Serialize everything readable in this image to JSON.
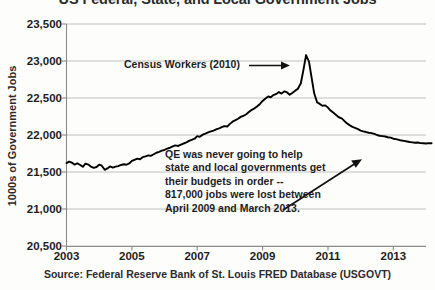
{
  "chart_data": {
    "type": "line",
    "title": "US Federal, State, and Local Government Jobs",
    "xlabel": "",
    "ylabel": "1000s of Government Jobs",
    "ylim": [
      20500,
      23500
    ],
    "xlim": [
      2003.0,
      2014.0
    ],
    "ytick_labels": [
      "23,500",
      "23,000",
      "22,500",
      "22,000",
      "21,500",
      "21,000",
      "20,500"
    ],
    "ytick_values": [
      23500,
      23000,
      22500,
      22000,
      21500,
      21000,
      20500
    ],
    "xtick_labels": [
      "2003",
      "2005",
      "2007",
      "2009",
      "2011",
      "2013"
    ],
    "xtick_values": [
      2003,
      2005,
      2007,
      2009,
      2011,
      2013
    ],
    "grid": true,
    "legend": "none",
    "line_color": "#000000",
    "series": [
      {
        "name": "Government Jobs (USGOVT)",
        "x": [
          2003.0,
          2003.08,
          2003.17,
          2003.25,
          2003.33,
          2003.42,
          2003.5,
          2003.58,
          2003.67,
          2003.75,
          2003.83,
          2003.92,
          2004.0,
          2004.08,
          2004.17,
          2004.25,
          2004.33,
          2004.42,
          2004.5,
          2004.58,
          2004.67,
          2004.75,
          2004.83,
          2004.92,
          2005.0,
          2005.08,
          2005.17,
          2005.25,
          2005.33,
          2005.42,
          2005.5,
          2005.58,
          2005.67,
          2005.75,
          2005.83,
          2005.92,
          2006.0,
          2006.08,
          2006.17,
          2006.25,
          2006.33,
          2006.42,
          2006.5,
          2006.58,
          2006.67,
          2006.75,
          2006.83,
          2006.92,
          2007.0,
          2007.08,
          2007.17,
          2007.25,
          2007.33,
          2007.42,
          2007.5,
          2007.58,
          2007.67,
          2007.75,
          2007.83,
          2007.92,
          2008.0,
          2008.08,
          2008.17,
          2008.25,
          2008.33,
          2008.42,
          2008.5,
          2008.58,
          2008.67,
          2008.75,
          2008.83,
          2008.92,
          2009.0,
          2009.08,
          2009.17,
          2009.25,
          2009.33,
          2009.42,
          2009.5,
          2009.58,
          2009.67,
          2009.75,
          2009.83,
          2009.92,
          2010.0,
          2010.08,
          2010.17,
          2010.25,
          2010.33,
          2010.42,
          2010.58,
          2010.67,
          2010.75,
          2010.83,
          2010.92,
          2011.0,
          2011.08,
          2011.17,
          2011.25,
          2011.33,
          2011.42,
          2011.5,
          2011.58,
          2011.67,
          2011.75,
          2011.83,
          2011.92,
          2012.0,
          2012.08,
          2012.17,
          2012.25,
          2012.33,
          2012.42,
          2012.5,
          2012.58,
          2012.67,
          2012.75,
          2012.83,
          2012.92,
          2013.0,
          2013.08,
          2013.17,
          2013.25,
          2013.33,
          2013.42,
          2013.5,
          2013.58,
          2013.67,
          2013.75,
          2013.83,
          2013.92,
          2014.0,
          2014.08,
          2014.17
        ],
        "y": [
          21620,
          21640,
          21625,
          21600,
          21618,
          21595,
          21570,
          21612,
          21600,
          21572,
          21556,
          21568,
          21600,
          21585,
          21530,
          21548,
          21575,
          21560,
          21572,
          21580,
          21595,
          21605,
          21598,
          21615,
          21650,
          21665,
          21680,
          21672,
          21700,
          21712,
          21725,
          21718,
          21740,
          21760,
          21772,
          21788,
          21800,
          21815,
          21828,
          21845,
          21860,
          21852,
          21870,
          21885,
          21900,
          21920,
          21935,
          21950,
          21985,
          21975,
          22005,
          22020,
          22035,
          22050,
          22060,
          22075,
          22090,
          22105,
          22120,
          22115,
          22150,
          22180,
          22200,
          22220,
          22245,
          22260,
          22280,
          22310,
          22340,
          22360,
          22385,
          22420,
          22460,
          22490,
          22520,
          22510,
          22540,
          22555,
          22580,
          22560,
          22590,
          22575,
          22545,
          22570,
          22600,
          22625,
          22700,
          22880,
          23080,
          22990,
          22560,
          22440,
          22420,
          22395,
          22400,
          22370,
          22330,
          22300,
          22270,
          22240,
          22225,
          22190,
          22160,
          22130,
          22110,
          22095,
          22080,
          22060,
          22050,
          22040,
          22030,
          22025,
          22015,
          22000,
          21990,
          21985,
          21980,
          21970,
          21965,
          21950,
          21945,
          21935,
          21925,
          21920,
          21912,
          21905,
          21900,
          21895,
          21898,
          21890,
          21888,
          21885,
          21890,
          21888
        ]
      }
    ],
    "annotations": [
      {
        "id": "census",
        "text": "Census Workers (2010)",
        "arrow": "right",
        "points_to": "2010 census spike"
      },
      {
        "id": "qe",
        "text": "QE was never going to help\nstate and local governments get\ntheir budgets in order --\n817,000 jobs were lost between\nApril 2009 and March 2013.",
        "arrow": "up-right",
        "points_to": "2013 flat tail"
      }
    ],
    "source": "Source:  Federal Reserve Bank of St. Louis FRED Database (USGOVT)"
  }
}
